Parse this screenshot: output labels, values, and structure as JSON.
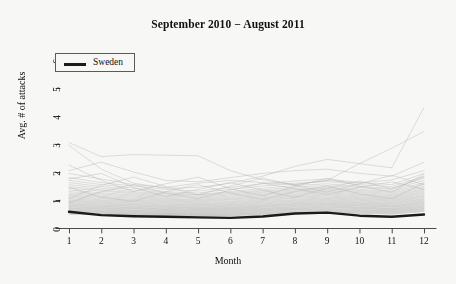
{
  "chart_data": {
    "type": "line",
    "title": "September 2010 − August 2011",
    "xlabel": "Month",
    "ylabel": "Avg. # of attacks",
    "xlim": [
      1,
      12
    ],
    "ylim": [
      0,
      6
    ],
    "xticks": [
      1,
      2,
      3,
      4,
      5,
      6,
      7,
      8,
      9,
      10,
      11,
      12
    ],
    "yticks": [
      0,
      1,
      2,
      3,
      4,
      5,
      6
    ],
    "grid": false,
    "legend": {
      "position": "top-left",
      "entries": [
        {
          "name": "Sweden",
          "color": "#1b1b1b"
        }
      ]
    },
    "x": [
      1,
      2,
      3,
      4,
      5,
      6,
      7,
      8,
      9,
      10,
      11,
      12
    ],
    "highlight_series": {
      "name": "Sweden",
      "color": "#1b1b1b",
      "width": 2.4,
      "values": [
        0.58,
        0.46,
        0.42,
        0.4,
        0.38,
        0.36,
        0.41,
        0.52,
        0.55,
        0.44,
        0.4,
        0.48
      ]
    },
    "background_color": "#b4b4b4",
    "series": [
      {
        "name": "c01",
        "values": [
          3.05,
          2.55,
          2.62,
          2.6,
          2.58,
          2.05,
          1.72,
          1.55,
          1.7,
          2.3,
          2.85,
          3.45
        ]
      },
      {
        "name": "c02",
        "values": [
          2.95,
          2.1,
          1.6,
          1.42,
          1.45,
          1.6,
          1.85,
          2.2,
          2.45,
          2.3,
          2.15,
          4.3
        ]
      },
      {
        "name": "c03",
        "values": [
          2.05,
          2.35,
          2.0,
          1.7,
          1.65,
          1.8,
          1.95,
          2.05,
          2.1,
          1.95,
          1.85,
          2.35
        ]
      },
      {
        "name": "c04",
        "values": [
          1.95,
          1.75,
          1.55,
          1.45,
          1.6,
          1.7,
          1.62,
          1.55,
          1.7,
          1.6,
          1.72,
          2.05
        ]
      },
      {
        "name": "c05",
        "values": [
          1.8,
          1.62,
          1.5,
          1.38,
          1.32,
          1.45,
          1.58,
          1.68,
          1.75,
          1.62,
          1.55,
          1.95
        ]
      },
      {
        "name": "c06",
        "values": [
          1.7,
          1.55,
          1.42,
          1.3,
          1.25,
          1.38,
          1.5,
          1.6,
          1.66,
          1.55,
          1.48,
          1.85
        ]
      },
      {
        "name": "c07",
        "values": [
          1.62,
          1.48,
          1.36,
          1.26,
          1.2,
          1.3,
          1.42,
          1.52,
          1.58,
          1.48,
          1.42,
          1.78
        ]
      },
      {
        "name": "c08",
        "values": [
          1.55,
          1.42,
          1.3,
          1.22,
          1.18,
          1.26,
          1.36,
          1.46,
          1.52,
          1.44,
          1.38,
          1.7
        ]
      },
      {
        "name": "c09",
        "values": [
          1.48,
          1.36,
          1.26,
          1.18,
          1.14,
          1.22,
          1.32,
          1.4,
          1.46,
          1.38,
          1.32,
          1.62
        ]
      },
      {
        "name": "c10",
        "values": [
          1.42,
          1.32,
          1.22,
          1.14,
          1.1,
          1.18,
          1.28,
          1.36,
          1.42,
          1.34,
          1.28,
          1.56
        ]
      },
      {
        "name": "c11",
        "values": [
          1.36,
          1.26,
          1.18,
          1.1,
          1.06,
          1.14,
          1.24,
          1.32,
          1.38,
          1.3,
          1.24,
          1.5
        ]
      },
      {
        "name": "c12",
        "values": [
          1.3,
          1.22,
          1.14,
          1.06,
          1.02,
          1.1,
          1.2,
          1.28,
          1.34,
          1.26,
          1.2,
          1.45
        ]
      },
      {
        "name": "c13",
        "values": [
          1.25,
          1.17,
          1.1,
          1.03,
          0.99,
          1.06,
          1.16,
          1.24,
          1.3,
          1.22,
          1.16,
          1.4
        ]
      },
      {
        "name": "c14",
        "values": [
          1.2,
          1.13,
          1.06,
          1.0,
          0.96,
          1.03,
          1.12,
          1.2,
          1.26,
          1.18,
          1.13,
          1.36
        ]
      },
      {
        "name": "c15",
        "values": [
          1.16,
          1.09,
          1.02,
          0.97,
          0.93,
          1.0,
          1.08,
          1.16,
          1.22,
          1.15,
          1.09,
          1.32
        ]
      },
      {
        "name": "c16",
        "values": [
          1.12,
          1.05,
          0.99,
          0.94,
          0.9,
          0.96,
          1.05,
          1.12,
          1.18,
          1.11,
          1.06,
          1.28
        ]
      },
      {
        "name": "c17",
        "values": [
          1.08,
          1.01,
          0.96,
          0.91,
          0.87,
          0.93,
          1.01,
          1.09,
          1.15,
          1.08,
          1.03,
          1.24
        ]
      },
      {
        "name": "c18",
        "values": [
          1.04,
          0.98,
          0.93,
          0.88,
          0.84,
          0.9,
          0.98,
          1.06,
          1.11,
          1.05,
          1.0,
          1.2
        ]
      },
      {
        "name": "c19",
        "values": [
          1.0,
          0.95,
          0.9,
          0.85,
          0.82,
          0.87,
          0.95,
          1.02,
          1.08,
          1.02,
          0.97,
          1.16
        ]
      },
      {
        "name": "c20",
        "values": [
          0.97,
          0.92,
          0.87,
          0.82,
          0.79,
          0.84,
          0.92,
          0.99,
          1.05,
          0.99,
          0.94,
          1.13
        ]
      },
      {
        "name": "c21",
        "values": [
          0.94,
          0.89,
          0.84,
          0.8,
          0.77,
          0.82,
          0.89,
          0.96,
          1.02,
          0.96,
          0.91,
          1.1
        ]
      },
      {
        "name": "c22",
        "values": [
          0.91,
          0.86,
          0.82,
          0.77,
          0.74,
          0.79,
          0.86,
          0.93,
          0.99,
          0.93,
          0.88,
          1.06
        ]
      },
      {
        "name": "c23",
        "values": [
          0.88,
          0.83,
          0.79,
          0.75,
          0.72,
          0.77,
          0.83,
          0.9,
          0.96,
          0.9,
          0.86,
          1.03
        ]
      },
      {
        "name": "c24",
        "values": [
          0.85,
          0.81,
          0.77,
          0.73,
          0.7,
          0.74,
          0.81,
          0.87,
          0.93,
          0.88,
          0.83,
          1.0
        ]
      },
      {
        "name": "c25",
        "values": [
          0.82,
          0.78,
          0.74,
          0.7,
          0.68,
          0.72,
          0.78,
          0.85,
          0.9,
          0.85,
          0.8,
          0.97
        ]
      },
      {
        "name": "c26",
        "values": [
          0.8,
          0.76,
          0.72,
          0.68,
          0.66,
          0.7,
          0.76,
          0.82,
          0.88,
          0.83,
          0.78,
          0.94
        ]
      },
      {
        "name": "c27",
        "values": [
          0.77,
          0.73,
          0.7,
          0.66,
          0.64,
          0.68,
          0.74,
          0.8,
          0.85,
          0.8,
          0.76,
          0.91
        ]
      },
      {
        "name": "c28",
        "values": [
          0.75,
          0.71,
          0.68,
          0.64,
          0.62,
          0.66,
          0.71,
          0.77,
          0.83,
          0.78,
          0.74,
          0.88
        ]
      },
      {
        "name": "c29",
        "values": [
          0.72,
          0.69,
          0.65,
          0.62,
          0.6,
          0.64,
          0.69,
          0.75,
          0.8,
          0.75,
          0.71,
          0.86
        ]
      },
      {
        "name": "c30",
        "values": [
          0.7,
          0.67,
          0.63,
          0.6,
          0.58,
          0.62,
          0.67,
          0.72,
          0.78,
          0.73,
          0.69,
          0.83
        ]
      },
      {
        "name": "c31",
        "values": [
          0.68,
          0.64,
          0.61,
          0.58,
          0.56,
          0.6,
          0.65,
          0.7,
          0.75,
          0.71,
          0.67,
          0.8
        ]
      },
      {
        "name": "c32",
        "values": [
          0.65,
          0.62,
          0.59,
          0.56,
          0.54,
          0.58,
          0.63,
          0.68,
          0.73,
          0.69,
          0.65,
          0.78
        ]
      },
      {
        "name": "c33",
        "values": [
          0.63,
          0.6,
          0.57,
          0.54,
          0.52,
          0.56,
          0.61,
          0.66,
          0.7,
          0.66,
          0.63,
          0.75
        ]
      },
      {
        "name": "c34",
        "values": [
          0.61,
          0.58,
          0.55,
          0.52,
          0.51,
          0.54,
          0.59,
          0.64,
          0.68,
          0.64,
          0.61,
          0.73
        ]
      },
      {
        "name": "c35",
        "values": [
          0.59,
          0.56,
          0.53,
          0.51,
          0.49,
          0.52,
          0.57,
          0.61,
          0.66,
          0.62,
          0.59,
          0.7
        ]
      },
      {
        "name": "c36",
        "values": [
          0.57,
          0.54,
          0.51,
          0.49,
          0.47,
          0.5,
          0.55,
          0.59,
          0.63,
          0.6,
          0.57,
          0.68
        ]
      },
      {
        "name": "c37",
        "values": [
          0.55,
          0.52,
          0.5,
          0.47,
          0.46,
          0.49,
          0.53,
          0.57,
          0.61,
          0.58,
          0.55,
          0.66
        ]
      },
      {
        "name": "c38",
        "values": [
          0.53,
          0.5,
          0.48,
          0.46,
          0.44,
          0.47,
          0.51,
          0.55,
          0.59,
          0.56,
          0.53,
          0.63
        ]
      },
      {
        "name": "c39",
        "values": [
          0.51,
          0.49,
          0.46,
          0.44,
          0.43,
          0.45,
          0.49,
          0.53,
          0.57,
          0.54,
          0.51,
          0.61
        ]
      },
      {
        "name": "c40",
        "values": [
          0.49,
          0.47,
          0.45,
          0.43,
          0.41,
          0.44,
          0.47,
          0.51,
          0.55,
          0.52,
          0.49,
          0.59
        ]
      },
      {
        "name": "c41",
        "values": [
          0.9,
          1.3,
          1.55,
          1.25,
          1.05,
          1.35,
          1.6,
          1.4,
          1.2,
          1.45,
          1.65,
          1.38
        ]
      },
      {
        "name": "c42",
        "values": [
          1.45,
          1.1,
          0.95,
          1.3,
          1.55,
          1.25,
          1.02,
          1.3,
          1.5,
          1.22,
          1.05,
          1.6
        ]
      },
      {
        "name": "c43",
        "values": [
          1.75,
          1.95,
          1.45,
          1.12,
          1.38,
          1.62,
          1.35,
          1.1,
          1.42,
          1.68,
          1.4,
          1.82
        ]
      },
      {
        "name": "c44",
        "values": [
          2.25,
          1.7,
          1.3,
          1.58,
          1.82,
          1.4,
          1.15,
          1.48,
          1.78,
          1.5,
          1.28,
          1.92
        ]
      },
      {
        "name": "c45",
        "values": [
          1.05,
          1.52,
          1.82,
          1.48,
          1.18,
          1.5,
          1.78,
          1.52,
          1.28,
          1.58,
          1.88,
          1.55
        ]
      }
    ]
  }
}
